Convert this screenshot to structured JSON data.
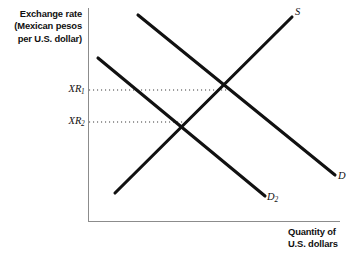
{
  "chart_data": {
    "type": "line",
    "title": "",
    "subtitle": "",
    "xlabel": "Quantity of U.S. dollars",
    "ylabel": "Exchange rate (Mexican pesos per U.S. dollar)",
    "grid": false,
    "legend": "none",
    "axis_style": "open-lower-left",
    "xlim": [
      0,
      100
    ],
    "ylim": [
      0,
      100
    ],
    "xticks": [],
    "yticks": [
      "XR1",
      "XR2"
    ],
    "ytick_labels": [
      "XR₁",
      "XR₂"
    ],
    "annotations": [
      "XR₁ is the equilibrium exchange rate where D crosses S",
      "XR₂ is the lower equilibrium exchange rate where D₂ crosses S",
      "A leftward shift of demand from D to D₂ lowers the exchange rate"
    ],
    "series": [
      {
        "name": "S",
        "label": "S",
        "kind": "supply",
        "slope": "upward",
        "color": "#111111",
        "points": [
          [
            115,
            193
          ],
          [
            292,
            17
          ]
        ]
      },
      {
        "name": "D",
        "label": "D",
        "kind": "demand",
        "slope": "downward",
        "color": "#111111",
        "points": [
          [
            138,
            15
          ],
          [
            335,
            175
          ]
        ]
      },
      {
        "name": "D2",
        "label": "D₂",
        "kind": "demand-shifted",
        "slope": "downward",
        "color": "#111111",
        "points": [
          [
            98,
            58
          ],
          [
            265,
            196
          ]
        ]
      }
    ],
    "equilibria": [
      {
        "name": "E1",
        "curves": [
          "D",
          "S"
        ],
        "price_label": "XR₁",
        "x": 231,
        "y": 90
      },
      {
        "name": "E2",
        "curves": [
          "D2",
          "S"
        ],
        "price_label": "XR₂",
        "x": 186,
        "y": 122
      }
    ],
    "guide_lines": [
      {
        "from_label": "XR₁",
        "x1": 89,
        "y1": 90,
        "x2": 231,
        "y2": 90,
        "style": "dotted"
      },
      {
        "from_label": "XR₂",
        "x1": 89,
        "y1": 122,
        "x2": 186,
        "y2": 122,
        "style": "dotted"
      }
    ],
    "axes": {
      "y_axis": {
        "x": 88,
        "y_top": 8,
        "y_bottom": 222,
        "color": "#8c8c8c"
      },
      "x_axis": {
        "y": 222,
        "x_left": 88,
        "x_right": 340,
        "color": "#8c8c8c"
      }
    }
  },
  "axis_titles": {
    "y_line1": "Exchange rate",
    "y_line2": "(Mexican pesos",
    "y_line3": "per U.S. dollar)",
    "x_line1": "Quantity of",
    "x_line2": "U.S. dollars"
  },
  "ticks": {
    "xr1_base": "XR",
    "xr1_sub": "1",
    "xr2_base": "XR",
    "xr2_sub": "2"
  },
  "curve_labels": {
    "supply": "S",
    "demand": "D",
    "demand_shifted_base": "D",
    "demand_shifted_sub": "2"
  },
  "colors": {
    "curve": "#111111",
    "axis": "#8c8c8c",
    "guide": "#3a3a3a",
    "background": "#ffffff"
  }
}
